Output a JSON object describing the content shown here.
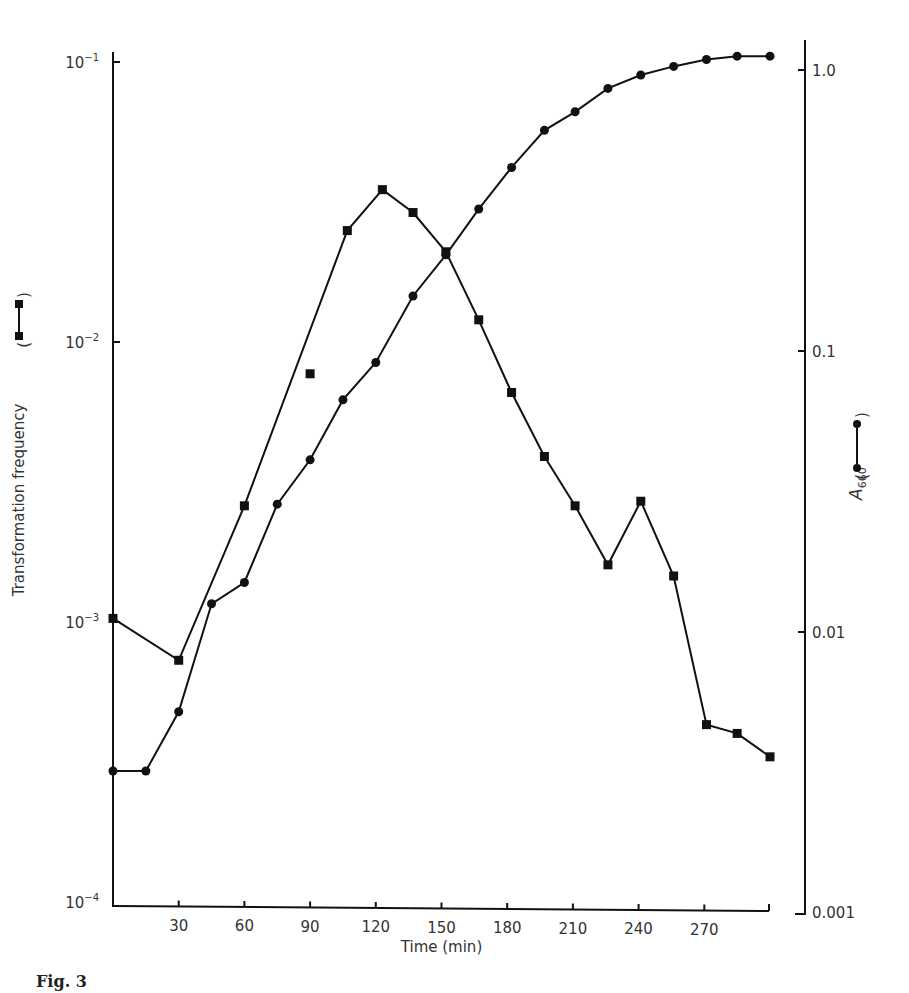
{
  "chart_data": {
    "type": "line",
    "title": "",
    "xlabel": "Time (min)",
    "ylabel_left": "Transformation frequency",
    "ylabel_right": "A660",
    "xlim": [
      0,
      300
    ],
    "x_ticks": [
      30,
      60,
      90,
      120,
      150,
      180,
      210,
      240,
      270
    ],
    "y_left_scale": "log",
    "ylim_left": [
      0.0001,
      0.1
    ],
    "y_left_ticks": [
      "10^-1",
      "10^-2",
      "10^-3",
      "10^-4"
    ],
    "y_right_scale": "log",
    "ylim_right": [
      0.001,
      1.0
    ],
    "y_right_ticks": [
      "1.0",
      "0.1",
      "0.01",
      "0.001"
    ],
    "grid": false,
    "legend": "inline in axis labels: square marker = transformation frequency, circle marker = A660",
    "series": [
      {
        "name": "Transformation frequency",
        "marker": "square",
        "axis": "left",
        "x": [
          0,
          30,
          60,
          90,
          107,
          123,
          137,
          152,
          167,
          182,
          197,
          211,
          226,
          241,
          256,
          271,
          285,
          300
        ],
        "values": [
          0.00103,
          0.00073,
          0.0026,
          0.0077,
          0.025,
          0.035,
          0.029,
          0.021,
          0.012,
          0.0066,
          0.0039,
          0.0026,
          0.0016,
          0.0027,
          0.00146,
          0.00043,
          0.0004,
          0.00033
        ],
        "connected": [
          true,
          true,
          true,
          false,
          true,
          true,
          true,
          true,
          true,
          true,
          true,
          true,
          true,
          true,
          true,
          true,
          true,
          true
        ]
      },
      {
        "name": "A660",
        "marker": "circle",
        "axis": "right",
        "x": [
          0,
          15,
          30,
          45,
          60,
          75,
          90,
          105,
          120,
          137,
          152,
          167,
          182,
          197,
          211,
          226,
          241,
          256,
          271,
          285,
          300
        ],
        "values": [
          0.0032,
          0.0032,
          0.0052,
          0.0126,
          0.015,
          0.0285,
          0.041,
          0.067,
          0.091,
          0.157,
          0.22,
          0.32,
          0.45,
          0.61,
          0.71,
          0.86,
          0.96,
          1.03,
          1.09,
          1.12,
          1.12
        ]
      }
    ]
  },
  "axes": {
    "x_label": "Time (min)",
    "x_ticks": [
      "30",
      "60",
      "90",
      "120",
      "150",
      "180",
      "210",
      "240",
      "270"
    ],
    "left_label": "Transformation frequency",
    "left_ticks": [
      {
        "base": "10",
        "exp": "−1"
      },
      {
        "base": "10",
        "exp": "−2"
      },
      {
        "base": "10",
        "exp": "−3"
      },
      {
        "base": "10",
        "exp": "−4"
      }
    ],
    "right_label_main": "A",
    "right_label_sub": "660",
    "right_ticks": [
      "1.0",
      "0.1",
      "0.01",
      "0.001"
    ]
  },
  "caption": "Fig. 3"
}
